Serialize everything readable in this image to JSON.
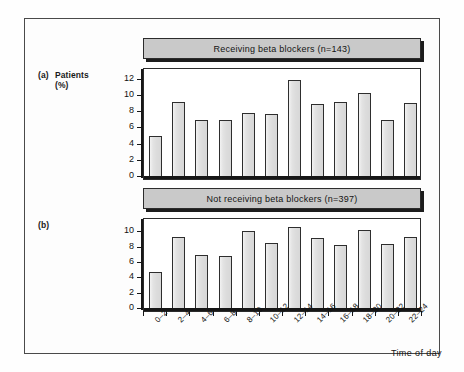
{
  "figure": {
    "panel_a_tag": "(a)",
    "panel_a_axis_label_line1": "Patients",
    "panel_a_axis_label_line2": "(%)",
    "panel_b_tag": "(b)",
    "xaxis_title": "Time of day",
    "colors": {
      "bar_fill": "#e3e3e3",
      "bar_outline": "#2e2e2e",
      "banner_fill": "#c9c9c9",
      "frame": "#2b2b2b",
      "page_border": "#4a4a4a",
      "background": "#fdfdfd"
    }
  },
  "chart_data": [
    {
      "type": "bar",
      "title": "Receiving beta blockers (n=143)",
      "panel": "(a)",
      "xlabel": "Time of day",
      "ylabel": "Patients (%)",
      "categories": [
        "0-2",
        "2-4",
        "4-6",
        "6-8",
        "8-10",
        "10-12",
        "12-14",
        "14-16",
        "16-18",
        "18-20",
        "20-22",
        "22-24"
      ],
      "values": [
        4.9,
        9.1,
        6.9,
        6.9,
        7.8,
        7.6,
        11.9,
        8.9,
        9.1,
        10.3,
        6.9,
        9.0
      ],
      "yticks": [
        0,
        2,
        4,
        6,
        8,
        10,
        12
      ],
      "ylim": [
        0,
        13.2
      ],
      "grid": false,
      "legend": "none",
      "n": 143
    },
    {
      "type": "bar",
      "title": "Not receiving beta blockers (n=397)",
      "panel": "(b)",
      "xlabel": "Time of day",
      "ylabel": "Patients (%)",
      "categories": [
        "0-2",
        "2-4",
        "4-6",
        "6-8",
        "8-10",
        "10-12",
        "12-14",
        "14-16",
        "16-18",
        "18-20",
        "20-22",
        "22-24"
      ],
      "values": [
        4.7,
        9.3,
        6.9,
        6.8,
        10.0,
        8.5,
        10.6,
        9.1,
        8.2,
        10.2,
        8.3,
        9.2
      ],
      "yticks": [
        0,
        2,
        4,
        6,
        8,
        10
      ],
      "ylim": [
        0,
        11.6
      ],
      "grid": false,
      "legend": "none",
      "n": 397
    }
  ],
  "xtick_labels": [
    "0–2",
    "2–4",
    "4–6",
    "6–8",
    "8–10",
    "10–12",
    "12–14",
    "14–16",
    "16–18",
    "18–20",
    "20–22",
    "22–24"
  ]
}
